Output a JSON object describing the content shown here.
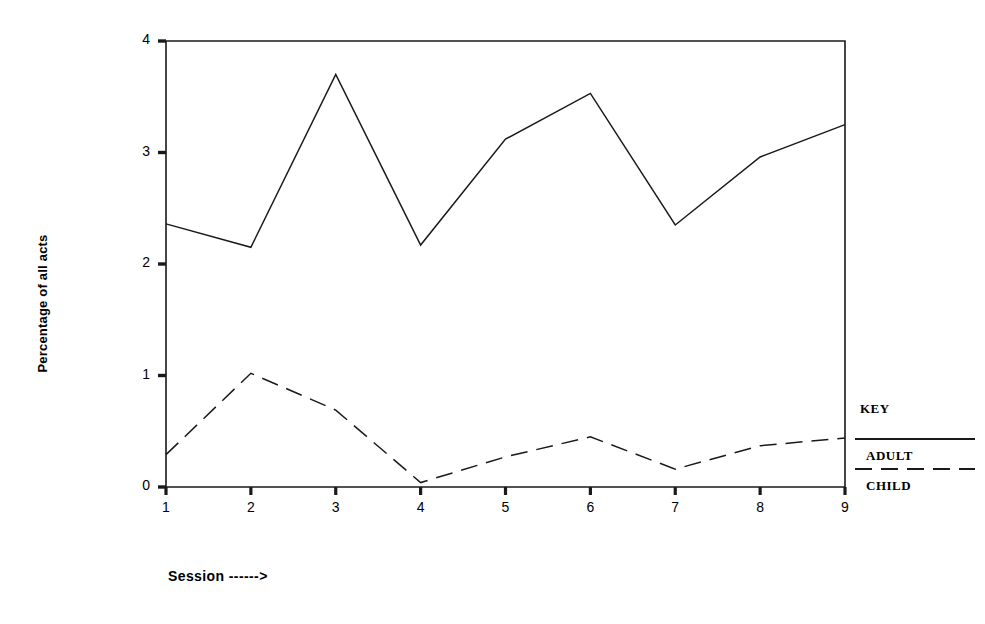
{
  "chart_data": {
    "type": "line",
    "title": "",
    "xlabel": "Session ------>",
    "ylabel": "Percentage of all acts",
    "x": [
      1,
      2,
      3,
      4,
      5,
      6,
      7,
      8,
      9
    ],
    "categories": [
      "1",
      "2",
      "3",
      "4",
      "5",
      "6",
      "7",
      "8",
      "9"
    ],
    "xlim": [
      1,
      9
    ],
    "ylim": [
      0,
      4
    ],
    "y_ticks": [
      "0",
      "1",
      "2",
      "3",
      "4"
    ],
    "y_tick_values": [
      0,
      1,
      2,
      3,
      4
    ],
    "grid": false,
    "legend_position": "right-outside",
    "legend_title": "KEY",
    "series": [
      {
        "name": "ADULT",
        "style": "solid",
        "color": "#1a1a1a",
        "values": [
          2.36,
          2.15,
          3.7,
          2.17,
          3.12,
          3.53,
          2.35,
          2.96,
          3.25
        ]
      },
      {
        "name": "CHILD",
        "style": "dashed",
        "color": "#1a1a1a",
        "values": [
          0.29,
          1.02,
          0.69,
          0.04,
          0.27,
          0.45,
          0.16,
          0.37,
          0.44
        ]
      }
    ]
  },
  "legend": {
    "title": "KEY",
    "entries": [
      {
        "label": "ADULT",
        "style": "solid"
      },
      {
        "label": "CHILD",
        "style": "dashed"
      }
    ]
  },
  "axes": {
    "y_label": "Percentage of all acts",
    "x_label": "Session ------>"
  }
}
